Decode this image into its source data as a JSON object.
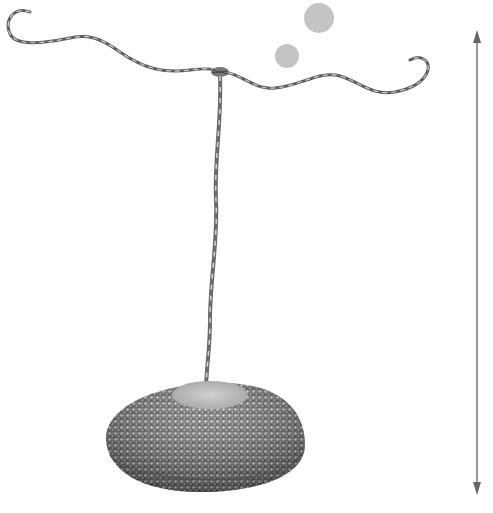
{
  "image": {
    "subject": "wire jewelry stand with beaded base",
    "background": "#ffffff"
  },
  "decor": {
    "dots": [
      {
        "cx": 319,
        "cy": 18,
        "r": 15,
        "color": "#c4c4c4"
      },
      {
        "cx": 287,
        "cy": 56,
        "r": 12,
        "color": "#c4c4c4"
      }
    ]
  },
  "height_indicator": {
    "x": 477,
    "y_top": 30,
    "y_bottom": 495,
    "color": "#777777",
    "icons": [
      "arrow-up-icon",
      "arrow-down-icon"
    ]
  },
  "colors": {
    "wire": "#8a8a8a",
    "wire_dark": "#5a5a5a",
    "bead_base": "#6e6e6e",
    "bead_top": "#b8b8b8"
  }
}
